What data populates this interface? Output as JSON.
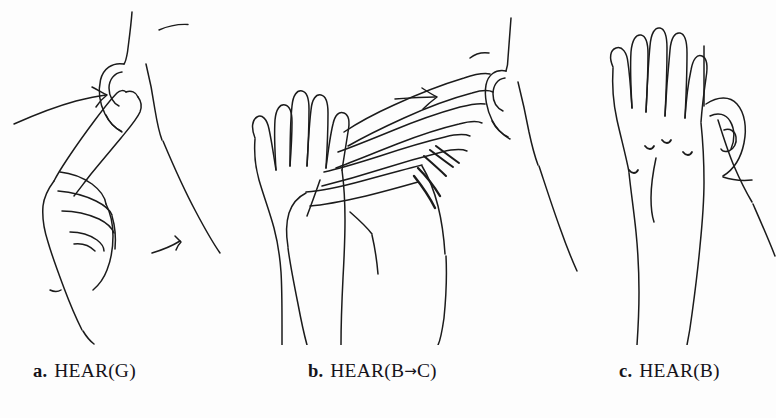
{
  "figure": {
    "background_color": "#fdfdfd",
    "ink_color": "#1b1b1b"
  },
  "panels": [
    {
      "id": "a",
      "handshape": "G",
      "drawing": "profile of a head with ear; an index finger (G handshape) extended upward from a closed fist touching the earlobe; a curved motion arrow approaching from the left",
      "elements": [
        "head-profile",
        "ear",
        "index-finger",
        "fist",
        "curved-motion-arrow",
        "small-motion-stroke"
      ]
    },
    {
      "id": "b",
      "handshape": "B→C",
      "drawing": "a flat open hand (B handshape) at left, a straight motion arrow pointing right, and a hand with fingers curving toward the ear (C handshape) beside a head profile",
      "elements": [
        "flat-open-hand",
        "straight-motion-arrow",
        "curving-hand",
        "head-profile",
        "ear"
      ]
    },
    {
      "id": "c",
      "handshape": "B",
      "drawing": "a flat open hand (B handshape) held beside the ear of a head profile",
      "elements": [
        "flat-open-hand",
        "head-profile",
        "ear"
      ]
    }
  ],
  "captions": [
    {
      "label": "a.",
      "gloss_prefix": "HEAR(G)",
      "gloss_arrow": "",
      "gloss_suffix": "",
      "full": "a. HEAR(G)"
    },
    {
      "label": "b.",
      "gloss_prefix": "HEAR(B",
      "gloss_arrow": "→",
      "gloss_suffix": "C)",
      "full": "b. HEAR(B→C)"
    },
    {
      "label": "c.",
      "gloss_prefix": "HEAR(B)",
      "gloss_arrow": "",
      "gloss_suffix": "",
      "full": "c. HEAR(B)"
    }
  ]
}
